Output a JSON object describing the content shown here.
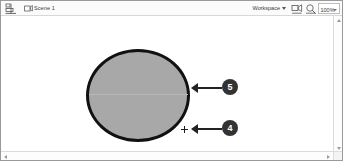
{
  "window": {
    "border_color": "#9a9a9a",
    "background": "#ffffff"
  },
  "edit_bar": {
    "background": "#fbfbfb",
    "back_icon_name": "back-to-scene-icon",
    "scene_icon_name": "scene-icon",
    "scene_label": "Scene 1",
    "workspace_label": "Workspace",
    "workspace_caret_name": "chevron-down-icon",
    "edit_scene_icon_name": "edit-scene-icon",
    "edit_symbol_icon_name": "edit-symbol-icon",
    "zoom_value": "100%",
    "zoom_caret_name": "chevron-down-icon"
  },
  "stage": {
    "background": "#ffffff",
    "shape": {
      "type": "ellipse",
      "fill_color": "#a8a8a8",
      "stroke_color": "#111111",
      "stroke_width_px": 3.5,
      "seam_color": "#b8b8b8"
    },
    "registration_point_name": "registration-point-crosshair"
  },
  "annotations": [
    {
      "number": "5",
      "target": "ellipse-right-edge-stroke"
    },
    {
      "number": "4",
      "target": "registration-point-crosshair"
    }
  ],
  "scrollbars": {
    "vertical_name": "vertical-scrollbar",
    "horizontal_name": "horizontal-scrollbar",
    "track_color": "#fdfdfd",
    "arrow_color": "#9b9b9b"
  }
}
